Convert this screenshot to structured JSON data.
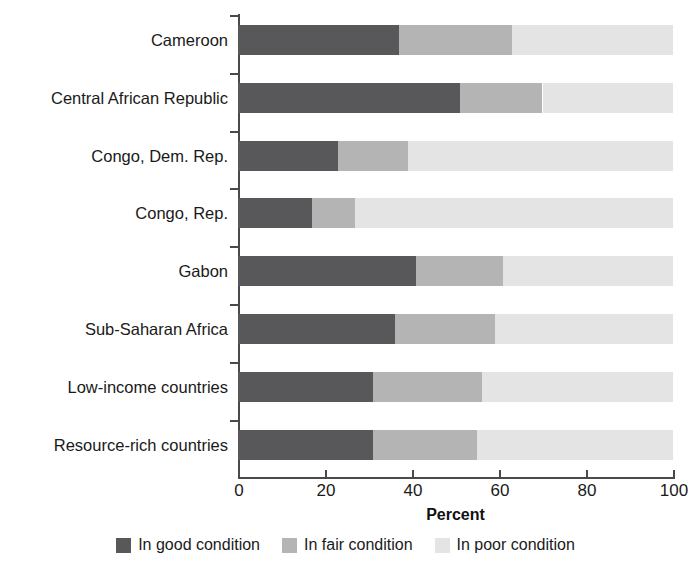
{
  "chart_data": {
    "type": "bar",
    "orientation": "horizontal",
    "stacked": true,
    "title": "",
    "xlabel": "Percent",
    "ylabel": "",
    "xlim": [
      0,
      100
    ],
    "xticks": [
      0,
      20,
      40,
      60,
      80,
      100
    ],
    "xtick_labels": [
      "0",
      "20",
      "40",
      "60",
      "80",
      "100"
    ],
    "grid": false,
    "legend_position": "bottom",
    "categories": [
      "Cameroon",
      "Central African Republic",
      "Congo, Dem. Rep.",
      "Congo, Rep.",
      "Gabon",
      "Sub-Saharan Africa",
      "Low-income countries",
      "Resource-rich countries"
    ],
    "series": [
      {
        "name": "In good condition",
        "color": "#58585a",
        "values": [
          37,
          51,
          23,
          17,
          41,
          36,
          31,
          31
        ]
      },
      {
        "name": "In fair condition",
        "color": "#b4b4b5",
        "values": [
          26,
          19,
          16,
          10,
          20,
          23,
          25,
          24
        ]
      },
      {
        "name": "In poor condition",
        "color": "#e4e4e4",
        "values": [
          37,
          30,
          61,
          73,
          39,
          41,
          44,
          45
        ]
      }
    ]
  },
  "legend": {
    "items": [
      {
        "label": "In good condition",
        "color": "#58585a"
      },
      {
        "label": "In fair condition",
        "color": "#b4b4b5"
      },
      {
        "label": "In poor condition",
        "color": "#e4e4e4"
      }
    ]
  }
}
